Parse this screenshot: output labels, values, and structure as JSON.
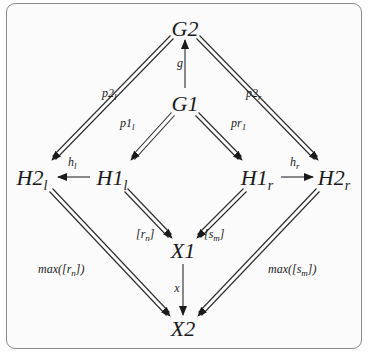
{
  "diagram": {
    "nodes": {
      "G2": {
        "base": "G2",
        "sub": ""
      },
      "G1": {
        "base": "G1",
        "sub": ""
      },
      "H2l": {
        "base": "H2",
        "sub": "l"
      },
      "H1l": {
        "base": "H1",
        "sub": "l"
      },
      "H1r": {
        "base": "H1",
        "sub": "r"
      },
      "H2r": {
        "base": "H2",
        "sub": "r"
      },
      "X1": {
        "base": "X1",
        "sub": ""
      },
      "X2": {
        "base": "X2",
        "sub": ""
      }
    },
    "edges": [
      {
        "from": "G1",
        "to": "G2",
        "style": "single",
        "label": "g"
      },
      {
        "from": "G2",
        "to": "H2l",
        "style": "double",
        "label": "p2_l"
      },
      {
        "from": "G2",
        "to": "H2r",
        "style": "double",
        "label": "p2_r"
      },
      {
        "from": "G1",
        "to": "H1l",
        "style": "double",
        "label": "p1_l"
      },
      {
        "from": "G1",
        "to": "H1r",
        "style": "double",
        "label": "pr_1"
      },
      {
        "from": "H1l",
        "to": "H2l",
        "style": "single",
        "label": "h_l"
      },
      {
        "from": "H1r",
        "to": "H2r",
        "style": "single",
        "label": "h_r"
      },
      {
        "from": "H1l",
        "to": "X1",
        "style": "double",
        "label": "[r_n]"
      },
      {
        "from": "H1r",
        "to": "X1",
        "style": "double",
        "label": "[s_m]"
      },
      {
        "from": "H2l",
        "to": "X2",
        "style": "double",
        "label": "max([r_n])"
      },
      {
        "from": "H2r",
        "to": "X2",
        "style": "double",
        "label": "max([s_m])"
      },
      {
        "from": "X1",
        "to": "X2",
        "style": "single",
        "label": "x"
      }
    ],
    "labels": {
      "g": "g",
      "p2l": {
        "base": "p2",
        "sub": "l"
      },
      "p2r": {
        "base": "p2",
        "sub": "r"
      },
      "p1l": {
        "base": "p1",
        "sub": "l"
      },
      "pr1": {
        "base": "pr",
        "sub": "1"
      },
      "hl": {
        "base": "h",
        "sub": "l"
      },
      "hr": {
        "base": "h",
        "sub": "r"
      },
      "rn": {
        "pre": "[r",
        "sub": "n",
        "post": "]"
      },
      "sm": {
        "pre": "[s",
        "sub": "m",
        "post": "]"
      },
      "maxrn": {
        "pre": "max([r",
        "sub": "n",
        "post": "])"
      },
      "maxsm": {
        "pre": "max([s",
        "sub": "m",
        "post": "])"
      },
      "x": "x"
    },
    "colors": {
      "line": "#2a2a2a",
      "frame": "#8a8a8a",
      "background": "#fbfbfb"
    }
  }
}
